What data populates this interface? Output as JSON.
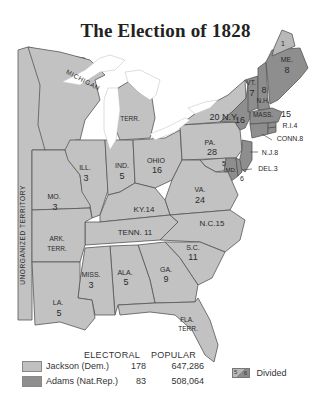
{
  "header": {
    "top_fragment": "...ntial Campaigns"
  },
  "title": "The Election of 1828",
  "colors": {
    "jackson": "#bdbdbd",
    "adams": "#8c8c8c",
    "water": "#ffffff",
    "border": "#555555"
  },
  "territories": {
    "unorganized": "UNORGANIZED TERRITORY",
    "michigan": "MICHIGAN",
    "michigan_terr": "TERR.",
    "arkansas": "ARK.",
    "arkansas_terr": "TERR.",
    "florida": "FLA.",
    "florida_terr": "TERR."
  },
  "states": [
    {
      "abbr": "ME.",
      "ev": "8",
      "party": "adams",
      "note": "1 Jackson (divided)"
    },
    {
      "abbr": "ME. split",
      "ev": "1",
      "party": "jackson"
    },
    {
      "abbr": "VT.",
      "ev": "7",
      "party": "adams"
    },
    {
      "abbr": "N.H.",
      "ev": "8",
      "party": "adams"
    },
    {
      "abbr": "MASS.",
      "ev": "15",
      "party": "adams"
    },
    {
      "abbr": "R.I.",
      "ev": "4",
      "party": "adams"
    },
    {
      "abbr": "CONN.",
      "ev": "8",
      "party": "adams"
    },
    {
      "abbr": "N.Y.",
      "ev": "20",
      "party": "jackson"
    },
    {
      "abbr": "N.Y. split",
      "ev": "16",
      "party": "adams"
    },
    {
      "abbr": "N.J.",
      "ev": "8",
      "party": "adams"
    },
    {
      "abbr": "PA.",
      "ev": "28",
      "party": "jackson"
    },
    {
      "abbr": "DEL.",
      "ev": "3",
      "party": "adams"
    },
    {
      "abbr": "MD.",
      "ev": "5",
      "party": "jackson"
    },
    {
      "abbr": "MD. split",
      "ev": "6",
      "party": "adams"
    },
    {
      "abbr": "VA.",
      "ev": "24",
      "party": "jackson"
    },
    {
      "abbr": "N.C.",
      "ev": "15",
      "party": "jackson"
    },
    {
      "abbr": "S.C.",
      "ev": "11",
      "party": "jackson"
    },
    {
      "abbr": "GA.",
      "ev": "9",
      "party": "jackson"
    },
    {
      "abbr": "ALA.",
      "ev": "5",
      "party": "jackson"
    },
    {
      "abbr": "MISS.",
      "ev": "3",
      "party": "jackson"
    },
    {
      "abbr": "LA.",
      "ev": "5",
      "party": "jackson"
    },
    {
      "abbr": "TENN.",
      "ev": "11",
      "party": "jackson"
    },
    {
      "abbr": "KY.",
      "ev": "14",
      "party": "jackson"
    },
    {
      "abbr": "OHIO",
      "ev": "16",
      "party": "jackson"
    },
    {
      "abbr": "IND.",
      "ev": "5",
      "party": "jackson"
    },
    {
      "abbr": "ILL.",
      "ev": "3",
      "party": "jackson"
    },
    {
      "abbr": "MO.",
      "ev": "3",
      "party": "jackson"
    }
  ],
  "legend": {
    "col_electoral": "ELECTORAL",
    "col_popular": "POPULAR",
    "rows": [
      {
        "name": "Jackson (Dem.)",
        "electoral": "178",
        "popular": "647,286"
      },
      {
        "name": "Adams (Nat.Rep.)",
        "electoral": "83",
        "popular": "508,064"
      }
    ],
    "divided": {
      "a": "5",
      "b": "6",
      "label": "Divided"
    }
  }
}
